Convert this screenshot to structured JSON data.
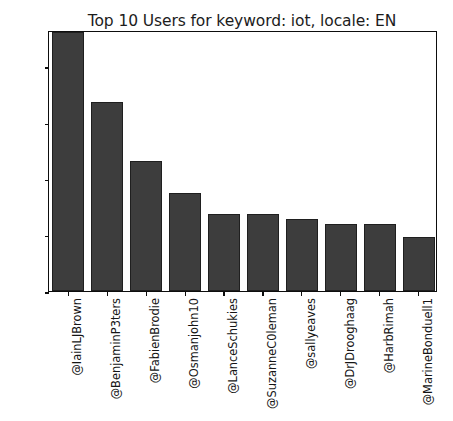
{
  "chart_data": {
    "type": "bar",
    "title": "Top 10 Users for keyword: iot, locale: EN",
    "xlabel": "",
    "ylabel": "",
    "categories": [
      "@IainLJBrown",
      "@BenjaminP3ters",
      "@FabienBrodie",
      "@Osmanjohn10",
      "@LanceSchukies",
      "@SuzanneC0leman",
      "@sallyeaves",
      "@DrJDrooghaag",
      "@HarbRimah",
      "@MarineBonduell1"
    ],
    "values": [
      920,
      672,
      462,
      348,
      275,
      274,
      255,
      240,
      239,
      192
    ],
    "ylim": [
      0,
      928
    ],
    "yticks": [
      0,
      200,
      400,
      600,
      800
    ],
    "ytick_labels": [
      "0",
      "200",
      "400",
      "600",
      "800"
    ],
    "grid": false,
    "legend": false,
    "bar_color": "#3d3d3d",
    "bar_edge_color": "#1f1f1f",
    "axis_color": "#0d0d0d",
    "background_color": "#ffffff"
  }
}
